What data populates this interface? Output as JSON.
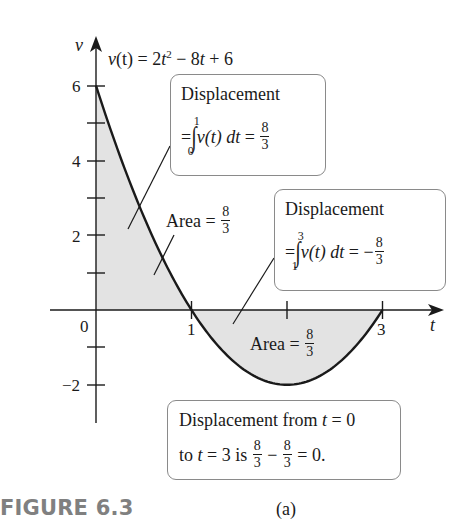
{
  "chart_data": {
    "type": "line",
    "function": "v(t) = 2t^2 - 8t + 6",
    "xlabel": "t",
    "ylabel": "v",
    "xlim": [
      0,
      3
    ],
    "ylim": [
      -2,
      6
    ],
    "x_ticks": [
      1,
      2,
      3
    ],
    "x_tick_labels": [
      "0",
      "1",
      "3"
    ],
    "y_ticks": [
      -2,
      -1,
      1,
      2,
      3,
      4,
      5,
      6
    ],
    "y_tick_labels": [
      "−2",
      "2",
      "4",
      "6"
    ],
    "x": [
      0,
      0.5,
      1,
      1.5,
      2,
      2.5,
      3
    ],
    "values": [
      6,
      2.5,
      0,
      -1.5,
      -2,
      -1.5,
      0
    ],
    "shaded_regions": [
      {
        "from_t": 0,
        "to_t": 1,
        "label": "Area = 8/3",
        "sign": "positive"
      },
      {
        "from_t": 1,
        "to_t": 3,
        "label": "Area = 8/3",
        "sign": "negative"
      }
    ],
    "annotations": [
      "Displacement = ∫₀¹ v(t) dt = 8/3",
      "Displacement = ∫₁³ v(t) dt = −8/3",
      "Displacement from t = 0 to t = 3 is 8/3 − 8/3 = 0."
    ],
    "grid": false,
    "legend": "none"
  },
  "axes": {
    "v_label": "v",
    "t_label": "t",
    "origin_label": "0",
    "t_tick_1": "1",
    "t_tick_3": "3",
    "v_tick_6": "6",
    "v_tick_4": "4",
    "v_tick_2": "2",
    "v_tick_neg2": "−2"
  },
  "equation": {
    "lhs": "v",
    "arg": "(t)",
    "eq": " = 2",
    "t1": "t",
    "exp": "2",
    "rest1": " − 8",
    "t2": "t",
    "rest2": " + 6"
  },
  "box1": {
    "title": "Displacement",
    "eq": "=",
    "upper": "1",
    "lower": "0",
    "integrand": "v(t) dt",
    "equals": " = ",
    "num": "8",
    "den": "3"
  },
  "box2": {
    "title": "Displacement",
    "eq": "=",
    "upper": "3",
    "lower": "1",
    "integrand": "v(t) dt",
    "equals": " = −",
    "num": "8",
    "den": "3"
  },
  "area1": {
    "text": "Area = ",
    "num": "8",
    "den": "3"
  },
  "area2": {
    "text": "Area = ",
    "num": "8",
    "den": "3"
  },
  "box3": {
    "line1_a": "Displacement from ",
    "line1_t": "t",
    "line1_b": " = 0",
    "line2_a": "to ",
    "line2_t": "t",
    "line2_b": " = 3 is ",
    "num1": "8",
    "den1": "3",
    "minus": " − ",
    "num2": "8",
    "den2": "3",
    "line2_c": " = 0."
  },
  "caption": "(a)",
  "figure_label": "FIGURE 6.3",
  "colors": {
    "curve": "#1a1a1a",
    "shade": "#e3e3e3",
    "box_border": "#8a8a8a",
    "figure_label": "#808080"
  }
}
